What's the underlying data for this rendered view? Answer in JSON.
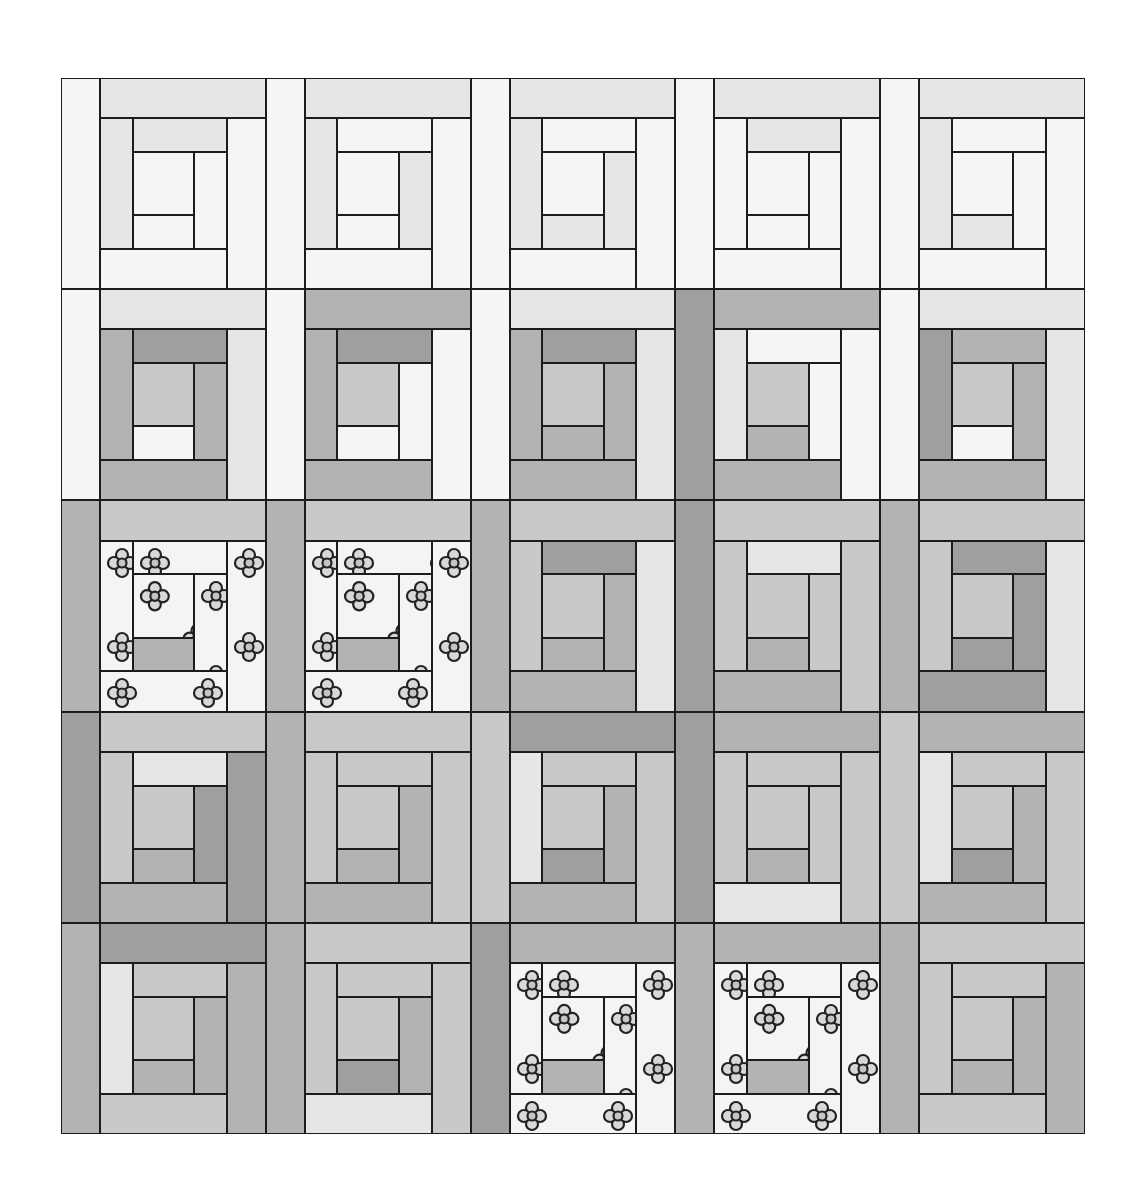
{
  "diagram": {
    "type": "log-cabin-quilt",
    "rows": 5,
    "columns": 5,
    "palette": {
      "W": "#f5f5f5",
      "L": "#e6e6e6",
      "M": "#c9c9c9",
      "G": "#b3b3b3",
      "D": "#9f9f9f",
      "F": "floral"
    },
    "blocks": [
      [
        "WLWWLLWW",
        "WLWWLWLW",
        "WLWWLWLL",
        "WLWWWLWW",
        "WLWWLWWL"
      ],
      [
        "WLLGGDGW",
        "WGWGGDWW",
        "WLLGGDGG",
        "DGWGLWWG",
        "WLLGDGGW"
      ],
      [
        "GMFFFFFG",
        "GMFFFFFG",
        "GMLGMDGG",
        "DMMGMLMG",
        "GMLDMDDD"
      ],
      [
        "DMDGMLDG",
        "GMMGMMGG",
        "MDMGLMGD",
        "DGMLMMMG",
        "MGMGLMGD"
      ],
      [
        "GDGMLMGG",
        "GMMLMMGD",
        "DGFFFFFG",
        "GGFFFFFG",
        "GMGMMMGG"
      ]
    ],
    "floral_blocks": [
      [
        2,
        0
      ],
      [
        2,
        1
      ],
      [
        4,
        2
      ],
      [
        4,
        3
      ]
    ]
  }
}
